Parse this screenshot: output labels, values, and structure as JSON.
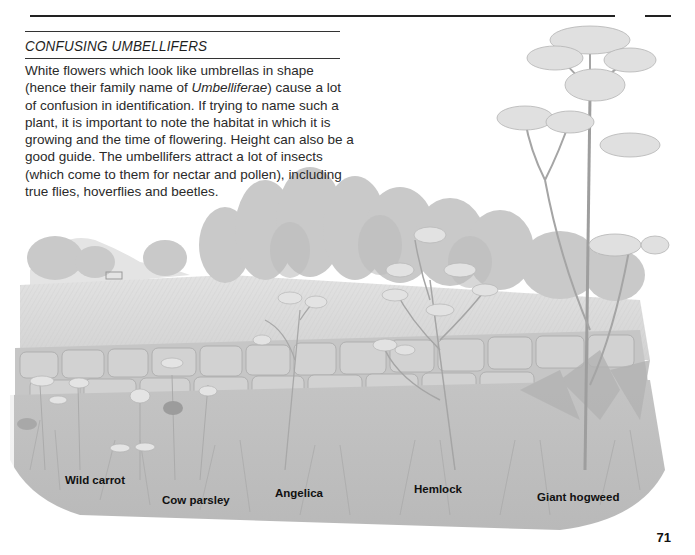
{
  "page": {
    "heading": "CONFUSING UMBELLIFERS",
    "body": {
      "part1": "White flowers which look like umbrellas in shape (hence their family name of ",
      "family_name": "Umbelliferae",
      "part2": ") cause a lot of confusion in identification. If trying to name such a plant, it is important to note the habitat in which it is growing and the time of flowering. Height can also be a good guide. The umbellifers attract a lot of insects (which come to them for nectar and pollen), including true flies, hoverflies and beetles."
    },
    "page_number": "71"
  },
  "illustration": {
    "description": "Hedgerow landscape with dry-stone wall, trees, field and umbelliferous plants",
    "labels": [
      {
        "name": "Wild carrot",
        "x": 65,
        "y": 481
      },
      {
        "name": "Cow parsley",
        "x": 162,
        "y": 501
      },
      {
        "name": "Angelica",
        "x": 275,
        "y": 494
      },
      {
        "name": "Hemlock",
        "x": 414,
        "y": 490
      },
      {
        "name": "Giant hogweed",
        "x": 537,
        "y": 497
      }
    ]
  }
}
